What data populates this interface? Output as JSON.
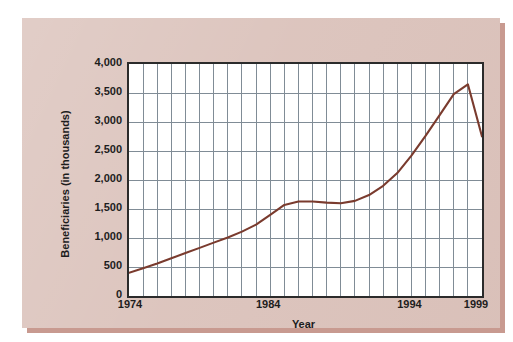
{
  "figure": {
    "card_background_color": "#dcc4bd",
    "card_shadow_color": "#c89a90",
    "page_background_color": "#ffffff",
    "plot_background_color": "#ffffff",
    "frame_color": "#2b2b2b",
    "grid_color": "#808c96",
    "series_color": "#7a3b2e"
  },
  "chart_data": {
    "type": "line",
    "title": "",
    "xlabel": "Year",
    "ylabel": "Beneficiaries (in thousands)",
    "xlim": [
      1974,
      1999
    ],
    "ylim": [
      0,
      4000
    ],
    "grid": true,
    "legend": null,
    "x_tick_labels": [
      "1974",
      "1984",
      "1994",
      "1999"
    ],
    "x_tick_values": [
      1974,
      1984,
      1994,
      1999
    ],
    "y_tick_labels": [
      "0",
      "500",
      "1,000",
      "1,500",
      "2,000",
      "2,500",
      "3,000",
      "3,500",
      "4,000"
    ],
    "y_tick_values": [
      0,
      500,
      1000,
      1500,
      2000,
      2500,
      3000,
      3500,
      4000
    ],
    "x_minor_step": 1,
    "y_major_step": 500,
    "x": [
      1974,
      1975,
      1976,
      1977,
      1978,
      1979,
      1980,
      1981,
      1982,
      1983,
      1984,
      1985,
      1986,
      1987,
      1988,
      1989,
      1990,
      1991,
      1992,
      1993,
      1994,
      1995,
      1996,
      1997,
      1998,
      1999
    ],
    "values": [
      400,
      480,
      560,
      650,
      740,
      830,
      920,
      1010,
      1110,
      1230,
      1400,
      1570,
      1630,
      1630,
      1610,
      1600,
      1640,
      1740,
      1900,
      2120,
      2420,
      2760,
      3120,
      3480,
      3650,
      3600
    ],
    "series": [
      {
        "name": "Beneficiaries",
        "color": "#7a3b2e",
        "values": [
          400,
          480,
          560,
          650,
          740,
          830,
          920,
          1010,
          1110,
          1230,
          1400,
          1570,
          1630,
          1630,
          1610,
          1600,
          1640,
          1740,
          1900,
          2120,
          2420,
          2760,
          3120,
          3480,
          3650,
          3600
        ]
      }
    ],
    "peak": {
      "year": 1998,
      "value": 3650
    },
    "end_value_1999": 2750
  }
}
